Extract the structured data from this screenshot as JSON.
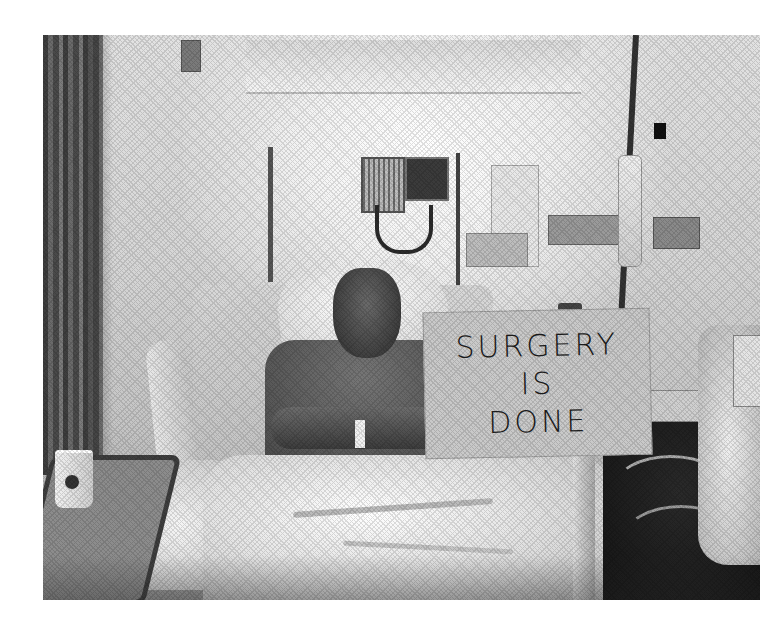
{
  "photo": {
    "description": "Black-and-white photograph of a patient sitting up in a hospital bed, holding a handwritten sign",
    "color_mode": "grayscale",
    "background_margin": "#ffffff",
    "frame": {
      "left": 43,
      "top": 35,
      "width": 717,
      "height": 565
    }
  },
  "sign": {
    "lines": [
      "SURGERY",
      "IS",
      "DONE"
    ],
    "color": "#c9c9c9",
    "text_color": "#1c1c1c"
  },
  "scene_elements": [
    "privacy-curtain",
    "ceiling-light-fixture",
    "wall-light-switch",
    "blood-pressure-monitor",
    "iv-pole",
    "iv-bag",
    "wall-gas-outlets",
    "hospital-bed",
    "bed-rail",
    "pillow",
    "patient",
    "hospital-gown",
    "wristband",
    "blanket",
    "overbed-tray-table",
    "paper-cup",
    "bedside-equipment",
    "tubing"
  ]
}
